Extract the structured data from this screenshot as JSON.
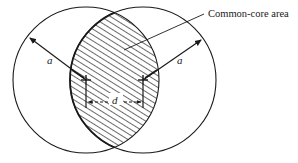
{
  "diagram": {
    "type": "overlapping-circles-dimension",
    "labels": {
      "common_core": "Common-core area",
      "radius_left": "a",
      "radius_right": "a",
      "center_distance": "d"
    },
    "geometry": {
      "left_center": [
        86,
        80
      ],
      "right_center": [
        143,
        80
      ],
      "radius": 73
    },
    "colors": {
      "stroke": "#1a1a1a",
      "background": "#ffffff",
      "hatch": "#1a1a1a"
    }
  }
}
